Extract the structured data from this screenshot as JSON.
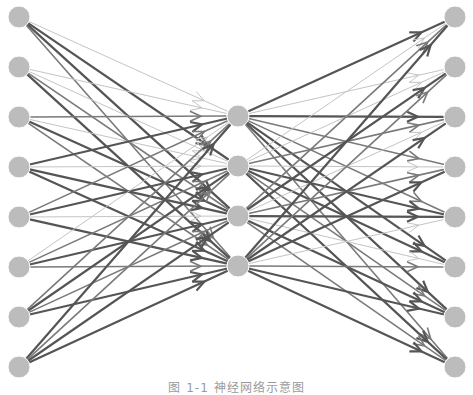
{
  "caption": "图 1-1  神经网络示意图",
  "style": {
    "node_color": "#bcbcbc",
    "node_radius": 11,
    "edge_colors": {
      "dark": "#555555",
      "mid": "#7a7a7a",
      "light": "#c4c4c4"
    },
    "edge_widths": {
      "dark": 2.2,
      "mid": 1.6,
      "light": 1.0
    }
  },
  "layers": [
    {
      "name": "input",
      "x": 19,
      "ys": [
        17,
        67,
        117,
        167,
        217,
        267,
        317,
        367
      ]
    },
    {
      "name": "hidden",
      "x": 238,
      "ys": [
        116,
        166,
        216,
        266
      ]
    },
    {
      "name": "output",
      "x": 455,
      "ys": [
        17,
        67,
        117,
        167,
        217,
        267,
        317,
        367
      ]
    }
  ],
  "edges_in_hidden": [
    [
      "light",
      "dark",
      "dark",
      "mid"
    ],
    [
      "light",
      "light",
      "mid",
      "dark"
    ],
    [
      "mid",
      "light",
      "dark",
      "mid"
    ],
    [
      "dark",
      "light",
      "dark",
      "dark"
    ],
    [
      "mid",
      "dark",
      "light",
      "dark"
    ],
    [
      "light",
      "mid",
      "dark",
      "mid"
    ],
    [
      "mid",
      "dark",
      "mid",
      "dark"
    ],
    [
      "dark",
      "mid",
      "dark",
      "dark"
    ]
  ],
  "edges_hidden_out": [
    [
      "dark",
      "light",
      "dark",
      "mid",
      "mid",
      "dark",
      "dark",
      "mid"
    ],
    [
      "light",
      "light",
      "mid",
      "light",
      "dark",
      "dark",
      "mid",
      "dark"
    ],
    [
      "mid",
      "dark",
      "light",
      "mid",
      "dark",
      "light",
      "dark",
      "mid"
    ],
    [
      "dark",
      "mid",
      "dark",
      "dark",
      "light",
      "mid",
      "dark",
      "dark"
    ]
  ]
}
